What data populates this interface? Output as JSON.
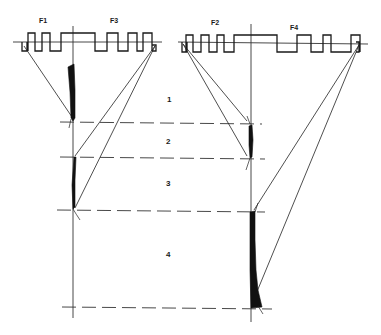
{
  "figure": {
    "left_panel": {
      "labels": {
        "f1": "F1",
        "f3": "F3"
      }
    },
    "right_panel": {
      "labels": {
        "f2": "F2",
        "f4": "F4"
      }
    },
    "zones": [
      {
        "id": "1",
        "label": "1"
      },
      {
        "id": "2",
        "label": "2"
      },
      {
        "id": "3",
        "label": "3"
      },
      {
        "id": "4",
        "label": "4"
      }
    ],
    "colors": {
      "ink": "#1a1a1a",
      "background": "#ffffff"
    }
  }
}
